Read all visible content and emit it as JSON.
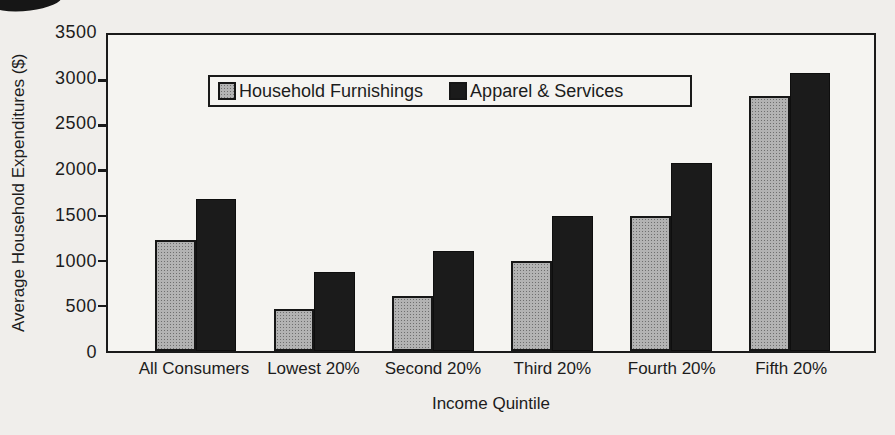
{
  "figure": {
    "background": "#f0eeeb",
    "text_color": "#1c1c1c"
  },
  "chart_data": {
    "type": "bar",
    "title": "",
    "xlabel": "Income Quintile",
    "ylabel": "Average Household Expenditures ($)",
    "ylim": [
      0,
      3500
    ],
    "ytick_interval": 500,
    "grid": false,
    "legend_position": "inside-top-center",
    "categories": [
      "All Consumers",
      "Lowest 20%",
      "Second 20%",
      "Third 20%",
      "Fourth 20%",
      "Fifth 20%"
    ],
    "series": [
      {
        "name": "Household Furnishings",
        "color": "#b3b3b3",
        "pattern": "stipple",
        "values": [
          1230,
          460,
          610,
          1000,
          1490,
          2820
        ]
      },
      {
        "name": "Apparel & Services",
        "color": "#1b1b1b",
        "pattern": "solid",
        "values": [
          1680,
          870,
          1110,
          1500,
          2080,
          3080
        ]
      }
    ]
  }
}
